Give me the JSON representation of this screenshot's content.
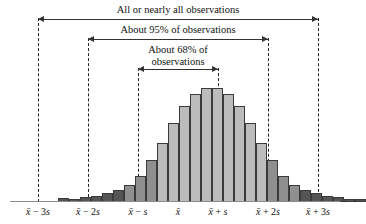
{
  "chart_data": {
    "type": "bar",
    "title": "",
    "xlabel": "",
    "ylabel": "",
    "grid": false,
    "legend_position": "none",
    "x_tick_labels": [
      "x̄ − 3s",
      "x̄ − 2s",
      "x̄ − s",
      "x̄",
      "x̄ + s",
      "x̄ + 2s",
      "x̄ + 3s"
    ],
    "x_tick_positions_px": [
      38,
      88,
      138,
      178,
      218,
      268,
      318
    ],
    "categories": [
      "-3.0s",
      "-2.8s",
      "-2.6s",
      "-2.4s",
      "-2.2s",
      "-2.0s",
      "-1.8s",
      "-1.6s",
      "-1.4s",
      "-1.2s",
      "-1.0s",
      "-0.8s",
      "-0.6s",
      "-0.4s",
      "-0.2s",
      "0.0s",
      "0.2s",
      "0.4s",
      "0.6s",
      "0.8s",
      "1.0s",
      "1.2s",
      "1.4s",
      "1.6s",
      "1.8s",
      "2.0s",
      "2.2s",
      "2.4s"
    ],
    "values": [
      4,
      3,
      5,
      6,
      9,
      13,
      18,
      27,
      44,
      62,
      83,
      101,
      113,
      120,
      120,
      113,
      101,
      83,
      62,
      44,
      27,
      18,
      13,
      9,
      6,
      5,
      3,
      2
    ],
    "ylim": [
      0,
      124
    ],
    "bar_shade_dark": "#555555",
    "bar_shade_mid": "#8f8f8f",
    "bar_shade_light": "#bcbcbc",
    "bar_outline": "#3a3a3a",
    "baseline_color": "#8a8a8a",
    "annotations": [
      {
        "label": "All or nearly all observations",
        "from_px": 38,
        "to_px": 318
      },
      {
        "label": "About 95% of observations",
        "from_px": 88,
        "to_px": 268
      },
      {
        "label": "About 68% of observations",
        "from_px": 138,
        "to_px": 218
      }
    ]
  },
  "brackets": {
    "all": {
      "label": "All or nearly all observations"
    },
    "ninetyfive": {
      "label": "About 95% of observations"
    },
    "sixtyeight": {
      "label": "About 68% of observations"
    }
  },
  "axis": {
    "ticks": [
      {
        "label": "x̄ − 3s"
      },
      {
        "label": "x̄ − 2s"
      },
      {
        "label": "x̄ − s"
      },
      {
        "label": "x̄"
      },
      {
        "label": "x̄ + s"
      },
      {
        "label": "x̄ + 2s"
      },
      {
        "label": "x̄ + 3s"
      }
    ]
  }
}
